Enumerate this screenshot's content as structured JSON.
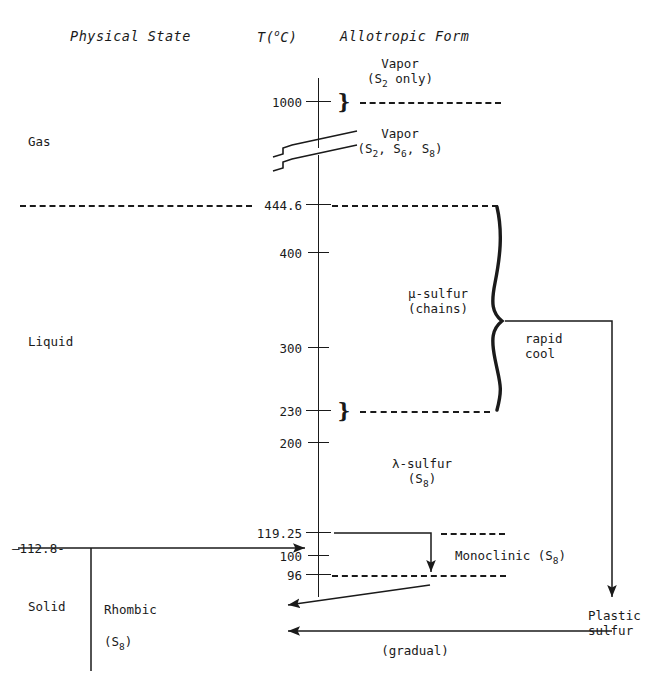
{
  "diagram": {
    "title_columns": [
      {
        "id": "physical-state",
        "label": "Physical State",
        "x": 70,
        "y": 36
      },
      {
        "id": "temperature",
        "label": "T(",
        "sup": "o",
        "label2": "C)",
        "x": 257,
        "y": 36
      },
      {
        "id": "allotropic-form",
        "label": "Allotropic Form",
        "x": 340,
        "y": 36
      }
    ],
    "axis": {
      "label": "T(°C)",
      "x": 318,
      "top": 78,
      "bottom": 597,
      "break_y": [
        143,
        160
      ],
      "ticks": [
        {
          "value": "1000",
          "y": 102
        },
        {
          "value": "444.6",
          "y": 205
        },
        {
          "value": "400",
          "y": 253
        },
        {
          "value": "300",
          "y": 348
        },
        {
          "value": "230",
          "y": 411
        },
        {
          "value": "200",
          "y": 443
        },
        {
          "value": "119.25",
          "y": 533
        },
        {
          "value": "100",
          "y": 556
        },
        {
          "value": "96",
          "y": 575
        }
      ]
    },
    "states": [
      {
        "id": "gas",
        "label": "Gas",
        "x": 28,
        "y": 141
      },
      {
        "id": "liquid",
        "label": "Liquid",
        "x": 28,
        "y": 341
      },
      {
        "id": "solid",
        "label": "Solid",
        "x": 28,
        "y": 606
      }
    ],
    "allotropes": [
      {
        "id": "vapor-s2",
        "line1": "Vapor",
        "line2": "(S",
        "sub2": "2",
        "line2b": " only)",
        "x": 400,
        "y": 62
      },
      {
        "id": "vapor-mixed",
        "line1": "Vapor",
        "line2": "(S",
        "sub2": "2",
        "line2b": ", S",
        "sub2b": "6",
        "line2c": ", S",
        "sub2d": "8",
        "line2e": ")",
        "x": 400,
        "y": 131
      },
      {
        "id": "mu-sulfur",
        "line1": "μ-sulfur",
        "line2": "(chains)",
        "x": 438,
        "y": 292
      },
      {
        "id": "lambda-sulfur",
        "line1": "λ-sulfur",
        "line2": "(S",
        "sub2": "8",
        "line2b": ")",
        "x": 422,
        "y": 462
      },
      {
        "id": "monoclinic",
        "label": "Monoclinic (S",
        "sub": "8",
        "label2": ")",
        "x": 455,
        "y": 555
      },
      {
        "id": "rhombic",
        "line1": "Rhombic",
        "line2": "(S",
        "sub2": "8",
        "line2b": ")",
        "x": 104,
        "y": 600
      },
      {
        "id": "plastic-sulfur",
        "line1": "Plastic",
        "line2": "sulfur",
        "x": 588,
        "y": 615
      }
    ],
    "annotations": [
      {
        "id": "rapid-cool",
        "line1": "rapid",
        "line2": "cool",
        "x": 525,
        "y": 337
      },
      {
        "id": "gradual",
        "label": "(gradual)",
        "x": 415,
        "y": 650
      },
      {
        "id": "transition-112-8",
        "label": "—112.8-",
        "x": 12,
        "y": 548
      }
    ],
    "braces": [
      {
        "id": "brace-1000",
        "glyph": "}",
        "x": 344,
        "y": 102
      },
      {
        "id": "brace-230",
        "glyph": "}",
        "x": 344,
        "y": 411
      }
    ],
    "dashed_lines": [
      {
        "id": "dash-1000-right",
        "x": 360,
        "y": 102,
        "w": 141
      },
      {
        "id": "dash-444-left",
        "x": 20,
        "y": 205,
        "w": 232
      },
      {
        "id": "dash-444-right",
        "x": 332,
        "y": 205,
        "w": 166
      },
      {
        "id": "dash-230-right",
        "x": 360,
        "y": 411,
        "w": 130
      },
      {
        "id": "dash-119-right",
        "x": 441,
        "y": 533,
        "w": 64
      },
      {
        "id": "dash-96-right",
        "x": 332,
        "y": 575,
        "w": 174
      }
    ],
    "colors": {
      "ink": "#1a1a1a",
      "paper": "#ffffff"
    }
  }
}
